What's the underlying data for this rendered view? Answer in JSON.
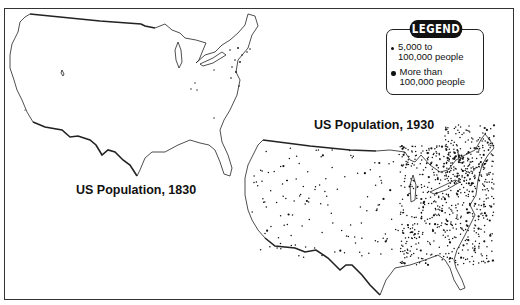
{
  "maps": [
    {
      "id": "map-1830",
      "title": "US Population, 1830"
    },
    {
      "id": "map-1930",
      "title": "US Population, 1930"
    }
  ],
  "legend": {
    "heading": "LEGEND",
    "items": [
      {
        "symbol": "small-dot",
        "label": "5,000 to\n100,000 people"
      },
      {
        "symbol": "large-dot",
        "label": "More than\n100,000 people"
      }
    ]
  },
  "colors": {
    "ink": "#111111",
    "background": "#ffffff",
    "frame": "#333333"
  }
}
